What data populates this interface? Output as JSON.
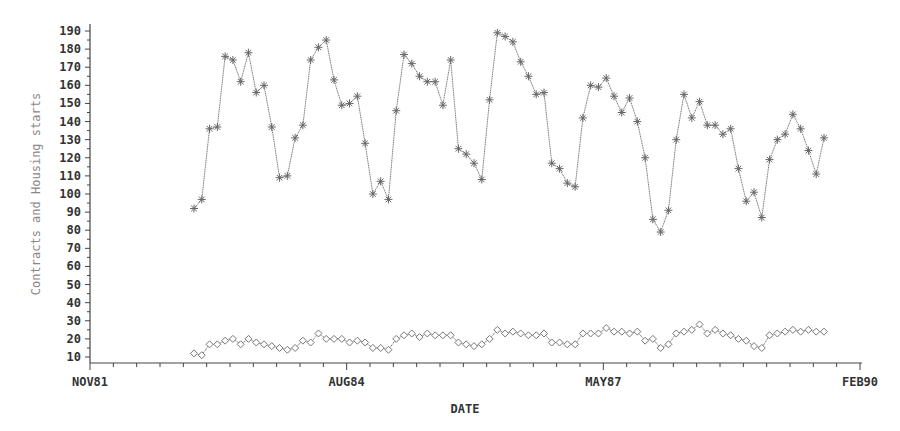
{
  "chart_data": {
    "type": "line",
    "title": "",
    "xlabel": "DATE",
    "ylabel": "Contracts and Housing starts",
    "ylim": [
      10,
      190
    ],
    "yticks": [
      10,
      20,
      30,
      40,
      50,
      60,
      70,
      80,
      90,
      100,
      110,
      120,
      130,
      140,
      150,
      160,
      170,
      180,
      190
    ],
    "xticks": [
      "NOV81",
      "AUG84",
      "MAY87",
      "FEB90"
    ],
    "x_minor_tick_interval_months": 3,
    "grid": false,
    "legend": null,
    "x_start": "JAN83",
    "x_step": "1 month",
    "series": [
      {
        "name": "Housing starts",
        "marker": "star",
        "color": "#777777",
        "values": [
          92,
          97,
          136,
          137,
          176,
          174,
          162,
          178,
          156,
          160,
          137,
          109,
          110,
          131,
          138,
          174,
          181,
          185,
          163,
          149,
          150,
          154,
          128,
          100,
          107,
          97,
          146,
          177,
          172,
          165,
          162,
          162,
          149,
          174,
          125,
          122,
          117,
          108,
          152,
          189,
          187,
          184,
          173,
          165,
          155,
          156,
          117,
          114,
          106,
          104,
          142,
          160,
          159,
          164,
          154,
          145,
          153,
          140,
          120,
          86,
          79,
          91,
          130,
          155,
          142,
          151,
          138,
          138,
          133,
          136,
          114,
          96,
          101,
          87,
          119,
          130,
          133,
          144,
          136,
          124,
          111,
          131
        ]
      },
      {
        "name": "Contracts",
        "marker": "diamond",
        "color": "#777777",
        "values": [
          12,
          11,
          17,
          17,
          19,
          20,
          17,
          20,
          18,
          17,
          16,
          15,
          14,
          15,
          19,
          18,
          23,
          20,
          20,
          20,
          18,
          19,
          18,
          15,
          15,
          14,
          20,
          22,
          23,
          21,
          23,
          22,
          22,
          22,
          18,
          17,
          16,
          17,
          20,
          25,
          23,
          24,
          23,
          22,
          22,
          23,
          18,
          18,
          17,
          17,
          23,
          23,
          23,
          26,
          24,
          24,
          23,
          24,
          19,
          20,
          15,
          17,
          23,
          24,
          25,
          28,
          23,
          25,
          23,
          22,
          20,
          19,
          16,
          15,
          22,
          23,
          24,
          25,
          24,
          25,
          24,
          24
        ]
      }
    ]
  },
  "axes": {
    "x_title": "DATE",
    "y_title": "Contracts and Housing starts"
  }
}
